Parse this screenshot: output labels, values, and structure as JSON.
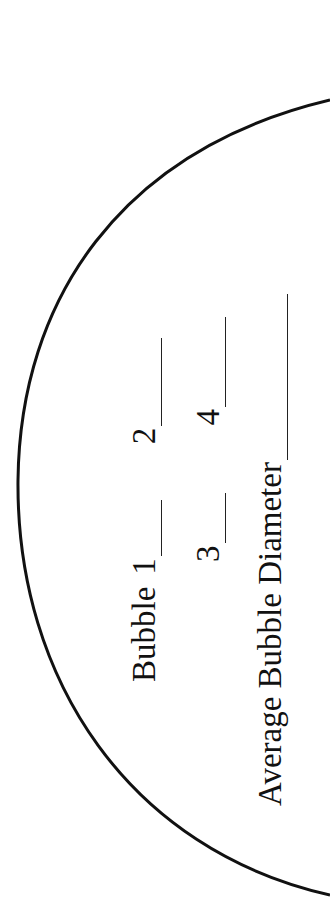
{
  "worksheet": {
    "row1": {
      "prefix": "Bubble",
      "field1_label": "1",
      "field2_label": "2"
    },
    "row2": {
      "field3_label": "3",
      "field4_label": "4"
    },
    "average": {
      "label": "Average Bubble Diameter"
    },
    "fields": {
      "bubble_1_value": "",
      "bubble_2_value": "",
      "bubble_3_value": "",
      "bubble_4_value": "",
      "average_value": ""
    },
    "colors": {
      "ink": "#111111",
      "paper": "#ffffff"
    }
  }
}
